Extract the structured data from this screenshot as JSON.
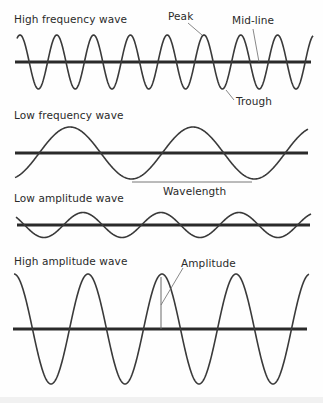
{
  "colors": {
    "background": "#fefefe",
    "wave": "#3a3a3a",
    "midline": "#2a2a2a",
    "leader": "#6a6a6a",
    "text": "#2a2a2a"
  },
  "panels": [
    {
      "id": "high-frequency",
      "title": "High frequency wave",
      "title_pos": [
        14,
        14
      ],
      "midline": {
        "y": 62,
        "x1": 15,
        "x2": 311
      },
      "wave": {
        "x1": 17,
        "x2": 313,
        "amplitude": 27,
        "period": 36.8,
        "first_peak_x": 20
      }
    },
    {
      "id": "low-frequency",
      "title": "Low frequency wave",
      "title_pos": [
        14,
        110
      ],
      "midline": {
        "y": 153,
        "x1": 15,
        "x2": 308
      },
      "wave": {
        "x1": 15,
        "x2": 308,
        "amplitude": 26,
        "period": 123,
        "first_peak_x": 70
      }
    },
    {
      "id": "low-amplitude",
      "title": "Low amplitude wave",
      "title_pos": [
        14,
        193
      ],
      "midline": {
        "y": 225,
        "x1": 17,
        "x2": 310
      },
      "wave": {
        "x1": 16,
        "x2": 311,
        "amplitude": 12.5,
        "period": 78,
        "first_peak_x": 83
      }
    },
    {
      "id": "high-amplitude",
      "title": "High amplitude wave",
      "title_pos": [
        14,
        256
      ],
      "midline": {
        "y": 329,
        "x1": 13,
        "x2": 307
      },
      "wave": {
        "x1": 14,
        "x2": 309,
        "amplitude": 55,
        "period": 74,
        "first_peak_x": 14
      }
    }
  ],
  "annotations": {
    "peak": {
      "label": "Peak",
      "pos": [
        168,
        11
      ],
      "leader": [
        [
          188,
          23
        ],
        [
          202,
          35
        ]
      ]
    },
    "midline": {
      "label": "Mid-line",
      "pos": [
        232,
        15
      ],
      "leader": [
        [
          253,
          29
        ],
        [
          259,
          62
        ]
      ]
    },
    "trough": {
      "label": "Trough",
      "pos": [
        236,
        96
      ],
      "leader": [
        [
          226,
          90
        ],
        [
          234,
          100
        ]
      ]
    },
    "wavelength": {
      "label": "Wavelength",
      "pos": [
        163,
        186
      ],
      "line": [
        [
          132,
          182
        ],
        [
          252,
          182
        ]
      ]
    },
    "amplitude": {
      "label": "Amplitude",
      "pos": [
        181,
        258
      ],
      "line": [
        [
          161,
          277
        ],
        [
          161,
          329
        ]
      ],
      "leader": [
        [
          161,
          305
        ],
        [
          183,
          268
        ]
      ]
    }
  }
}
